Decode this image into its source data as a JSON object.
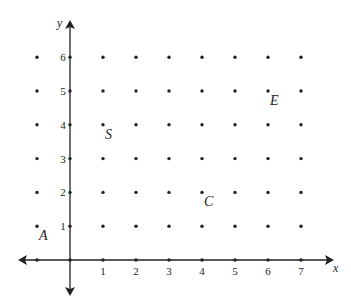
{
  "diagram": {
    "type": "coordinate-grid",
    "x_axis_label": "x",
    "y_axis_label": "y",
    "x_ticks": [
      "1",
      "2",
      "3",
      "4",
      "5",
      "6",
      "7"
    ],
    "y_ticks": [
      "1",
      "2",
      "3",
      "4",
      "5",
      "6"
    ],
    "grid_x_range": [
      -1,
      7
    ],
    "grid_y_range": [
      0,
      6
    ],
    "points": [
      {
        "label": "A",
        "x": -1,
        "y": 1
      },
      {
        "label": "S",
        "x": 1,
        "y": 4
      },
      {
        "label": "C",
        "x": 4,
        "y": 2
      },
      {
        "label": "E",
        "x": 6,
        "y": 5
      }
    ],
    "color": "#222222"
  }
}
